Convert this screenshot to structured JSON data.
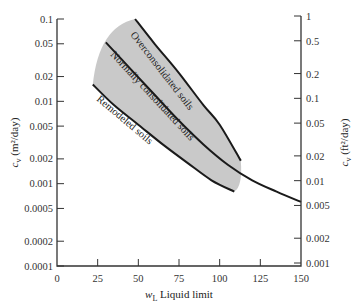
{
  "chart_data": {
    "type": "line",
    "title": "",
    "xlabel": "w_L Liquid limit",
    "xlabel_symbol": "w",
    "xlabel_subscript": "L",
    "xlabel_text": " Liquid limit",
    "ylabel_left": "c_v (m²/day)",
    "ylabel_left_symbol": "c",
    "ylabel_left_sub": "v",
    "ylabel_left_unit": " (m²/day)",
    "ylabel_right": "c_v (ft²/day)",
    "ylabel_right_symbol": "c",
    "ylabel_right_sub": "v",
    "ylabel_right_unit": " (ft²/day)",
    "xlim": [
      0,
      150
    ],
    "ylim_left": [
      0.0001,
      0.1
    ],
    "ylim_right": [
      0.001,
      1
    ],
    "yscale": "log",
    "grid": false,
    "x_ticks": [
      "0",
      "25",
      "50",
      "75",
      "100",
      "125",
      "150"
    ],
    "y_left_ticks": [
      "0.1",
      "0.05",
      "0.02",
      "0.01",
      "0.005",
      "0.002",
      "0.001",
      "0.0005",
      "0.0002",
      "0.0001"
    ],
    "y_right_ticks": [
      "1",
      "0.5",
      "0.2",
      "0.1",
      "0.05",
      "0.02",
      "0.01",
      "0.005",
      "0.002",
      "0.001"
    ],
    "shaded_region": {
      "description": "Range of c_v for undisturbed soils",
      "color": "#c8c8c8",
      "x_range": [
        22,
        113
      ]
    },
    "series": [
      {
        "name": "Overconsolidated soils",
        "x": [
          48,
          60,
          75,
          90,
          100,
          113
        ],
        "y": [
          0.1,
          0.05,
          0.022,
          0.009,
          0.0052,
          0.0019
        ]
      },
      {
        "name": "Normally consolidated soils",
        "x": [
          30,
          45,
          60,
          75,
          90,
          105,
          120,
          135,
          150
        ],
        "y": [
          0.052,
          0.025,
          0.012,
          0.0058,
          0.003,
          0.0017,
          0.0011,
          0.0008,
          0.0006
        ]
      },
      {
        "name": "Remodeled soils",
        "x": [
          22,
          35,
          50,
          65,
          80,
          95,
          109
        ],
        "y": [
          0.016,
          0.009,
          0.0052,
          0.003,
          0.0018,
          0.0011,
          0.0008
        ]
      }
    ],
    "curve_labels": [
      "Overconsolidated soils",
      "Normally consolidated soils",
      "Remodeled soils"
    ]
  },
  "colors": {
    "curve": "#1a1a1a",
    "shade": "#c9c9c9",
    "axis": "#333333"
  }
}
